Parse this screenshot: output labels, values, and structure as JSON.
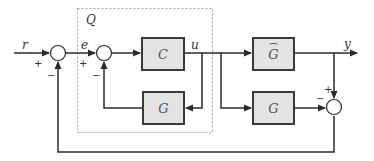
{
  "diagram": {
    "type": "block-diagram",
    "group": {
      "label": "Q"
    },
    "signals": {
      "input": "r",
      "error": "e",
      "control": "u",
      "output": "y"
    },
    "blocks": [
      {
        "id": "controller",
        "label": "C"
      },
      {
        "id": "inner-model",
        "label": "G"
      },
      {
        "id": "plant",
        "label": "G",
        "hat": true
      },
      {
        "id": "outer-model",
        "label": "G"
      }
    ],
    "sums": [
      {
        "id": "sum1",
        "signs": {
          "left": "+",
          "bottom": "−"
        }
      },
      {
        "id": "sum2",
        "signs": {
          "left": "+",
          "bottom": "−"
        }
      },
      {
        "id": "sum3",
        "signs": {
          "top": "+",
          "left": "−"
        }
      }
    ],
    "colors": {
      "line": "#2b2b2b",
      "block_fill": "#e3e3e3",
      "dashed_box": "#999999"
    }
  }
}
